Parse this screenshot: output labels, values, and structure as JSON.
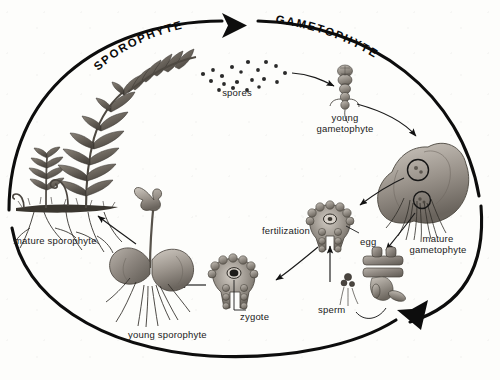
{
  "diagram": {
    "type": "biological-life-cycle-diagram",
    "background_color": "#fdfdfb",
    "ink_color": "#111111",
    "phases": [
      {
        "id": "sporophyte",
        "label": "SPOROPHYTE",
        "position": "top-left-arc"
      },
      {
        "id": "gametophyte",
        "label": "GAMETOPHYTE",
        "position": "top-right-arc"
      }
    ],
    "stages": [
      {
        "id": "spores",
        "label": "spores",
        "x": 236,
        "y": 94
      },
      {
        "id": "young-gametophyte",
        "label": "young\ngametophyte",
        "x": 344,
        "y": 120
      },
      {
        "id": "mature-gametophyte",
        "label": "mature\ngametophyte",
        "x": 438,
        "y": 241
      },
      {
        "id": "egg",
        "label": "egg",
        "x": 362,
        "y": 243
      },
      {
        "id": "fertilization",
        "label": "fertilization",
        "x": 292,
        "y": 233
      },
      {
        "id": "sperm",
        "label": "sperm",
        "x": 338,
        "y": 312
      },
      {
        "id": "zygote",
        "label": "zygote",
        "x": 256,
        "y": 319
      },
      {
        "id": "young-sporophyte",
        "label": "young sporophyte",
        "x": 174,
        "y": 337
      },
      {
        "id": "mature-sporophyte",
        "label": "mature sporophyte",
        "x": 68,
        "y": 243
      }
    ],
    "spore_dots": [
      [
        203,
        74
      ],
      [
        213,
        70
      ],
      [
        222,
        76
      ],
      [
        232,
        67
      ],
      [
        241,
        72
      ],
      [
        248,
        62
      ],
      [
        258,
        70
      ],
      [
        266,
        62
      ],
      [
        276,
        66
      ],
      [
        285,
        73
      ],
      [
        211,
        81
      ],
      [
        224,
        84
      ],
      [
        237,
        82
      ],
      [
        252,
        80
      ],
      [
        264,
        79
      ],
      [
        277,
        82
      ],
      [
        219,
        90
      ],
      [
        233,
        88
      ],
      [
        247,
        90
      ],
      [
        259,
        87
      ]
    ],
    "flow_arrows": [
      {
        "from": "spores",
        "to": "young-gametophyte"
      },
      {
        "from": "young-gametophyte",
        "to": "mature-gametophyte"
      },
      {
        "from": "mature-gametophyte",
        "to": "egg"
      },
      {
        "from": "sperm",
        "to": "egg"
      },
      {
        "from": "egg",
        "to": "zygote"
      },
      {
        "from": "zygote",
        "to": "young-sporophyte"
      },
      {
        "from": "young-sporophyte",
        "to": "mature-sporophyte"
      }
    ],
    "cycle_arrow_top": {
      "direction": "clockwise-right",
      "tip_x": 232,
      "tip_y": 25
    },
    "cycle_arrow_bottom": {
      "direction": "counterclockwise-down-right",
      "tip_x": 416,
      "tip_y": 323
    }
  }
}
